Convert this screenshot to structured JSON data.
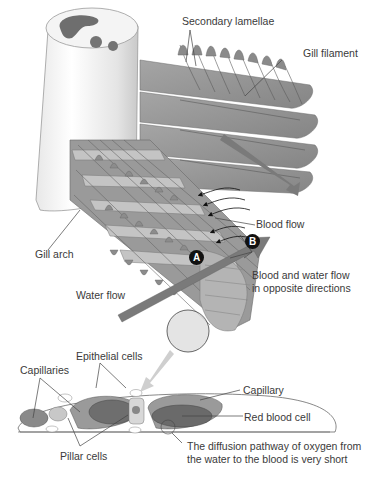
{
  "figure": {
    "title_fragment": "",
    "labels": {
      "secondary_lamellae": "Secondary lamellae",
      "gill_filament": "Gill filament",
      "gill_arch": "Gill arch",
      "blood_flow": "Blood flow",
      "water_flow": "Water flow",
      "counter_flow": "Blood and water flow in opposite directions",
      "epithelial_cells": "Epithelial cells",
      "capillaries": "Capillaries",
      "capillary": "Capillary",
      "red_blood_cell": "Red blood cell",
      "pillar_cells": "Pillar cells",
      "diffusion_note": "The diffusion pathway of oxygen from the water to the blood is very short"
    },
    "markers": {
      "a": "A",
      "b": "B"
    },
    "colors": {
      "lamella_fill": "#8e8e8e",
      "lamella_light": "#c9c9c9",
      "arch_fill": "#f2f2f2",
      "arrow_fill": "#7a7a7a",
      "cell_dark": "#6e6e6e",
      "cell_mid": "#9a9a9a",
      "line": "#444444"
    }
  }
}
